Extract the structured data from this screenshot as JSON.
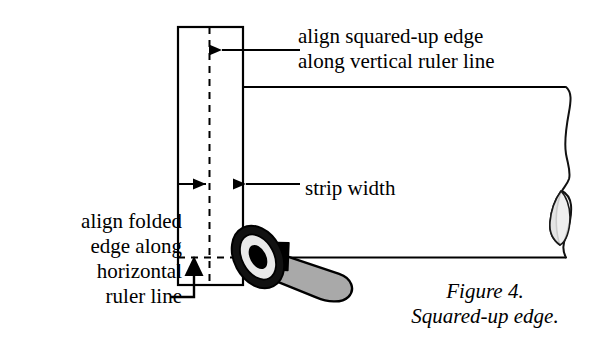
{
  "figure": {
    "caption_lines": [
      "Figure  4.",
      "Squared-up edge."
    ],
    "caption_number": "Figure  4.",
    "caption_title": "Squared-up edge."
  },
  "callouts": {
    "squared_up": {
      "lines": [
        "align squared-up edge",
        "along vertical ruler line"
      ],
      "line1": "align squared-up edge",
      "line2": "along vertical ruler line"
    },
    "folded": {
      "lines": [
        "align folded",
        "edge along",
        "horizontal",
        "ruler line"
      ],
      "line1": "align folded",
      "line2": "edge along",
      "line3": "horizontal",
      "line4": "ruler line"
    },
    "strip_width": {
      "label": "strip width"
    }
  },
  "icons": {
    "rotary_cutter": "rotary-cutter-icon",
    "arrow_left": "arrow-left-icon",
    "arrow_right": "arrow-right-icon",
    "arrow_up": "arrow-up-icon"
  },
  "colors": {
    "ink": "#000000",
    "background": "#ffffff",
    "blade_ring_light": "#e8e8e8",
    "blade_hub": "#000000",
    "handle_gray": "#a8a8a8",
    "fold_shade": "#b8b8b8",
    "fold_shade_light": "#e0e0e0"
  },
  "geometry": {
    "strip_left_x": 178,
    "strip_right_x": 243,
    "strip_top_y": 27,
    "strip_bottom_y": 285,
    "fold_line_x": 210,
    "fabric_top_y": 87,
    "fabric_bottom_y": 257,
    "fabric_right_x": 570
  }
}
